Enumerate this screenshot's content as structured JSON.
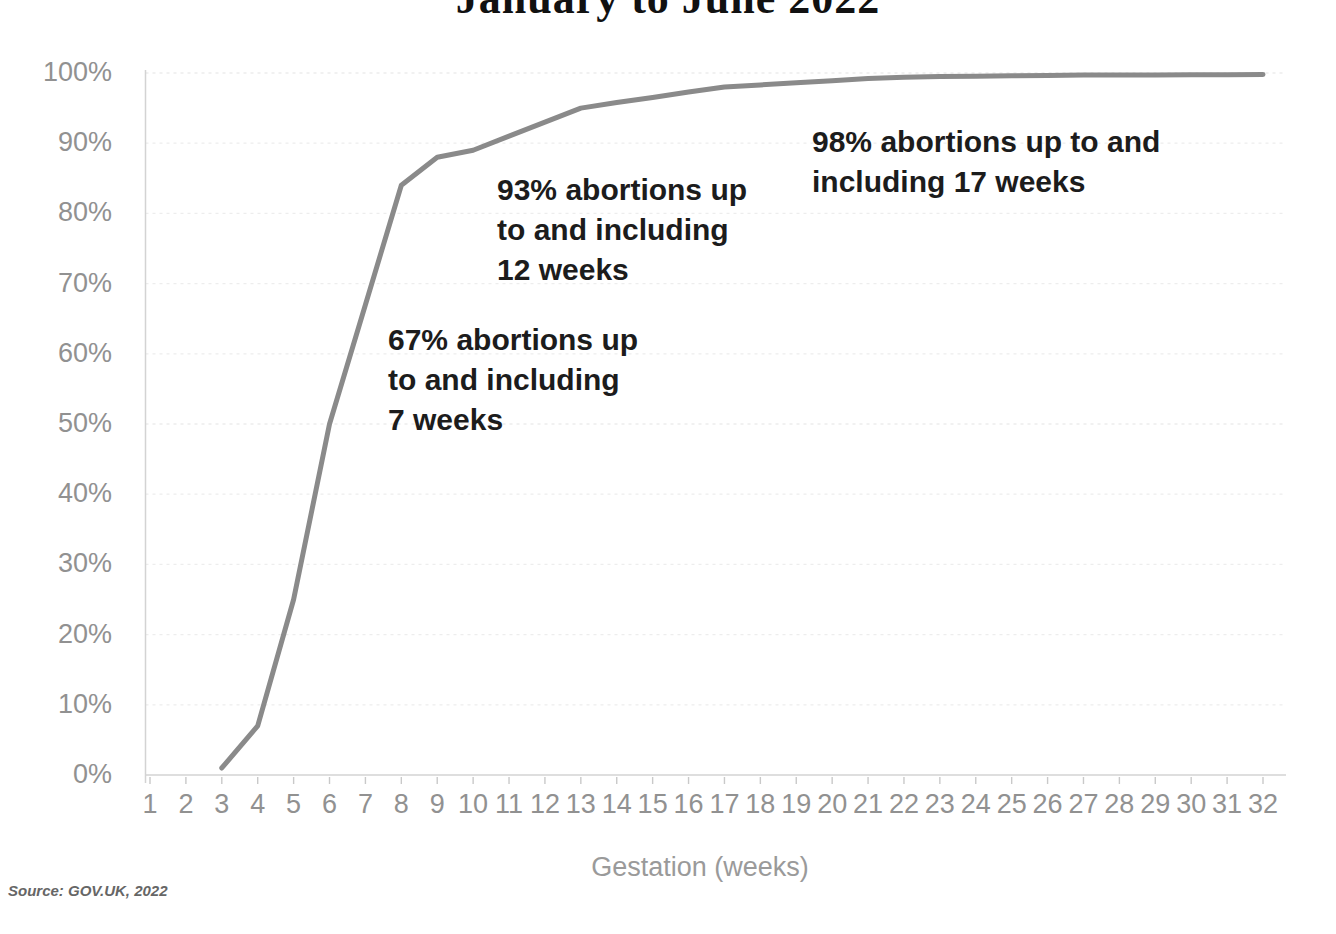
{
  "title": "January to June 2022",
  "source": "Source: GOV.UK, 2022",
  "annotations": [
    {
      "lines": [
        "67% abortions up",
        "to and including",
        "7 weeks"
      ]
    },
    {
      "lines": [
        "93% abortions up",
        "to and including",
        "12 weeks"
      ]
    },
    {
      "lines": [
        "98% abortions up to and",
        "including 17 weeks"
      ]
    }
  ],
  "colors": {
    "line": "#8a8a8a",
    "grid": "#ededed",
    "axis": "#d3d3d3",
    "tick": "#c9c9c9",
    "tick_label": "#919191",
    "annotation": "#1c1c1c",
    "title": "#111111",
    "source": "#666666"
  },
  "chart_data": {
    "type": "line",
    "title": "January to June 2022",
    "xlabel": "Gestation (weeks)",
    "ylabel": "",
    "xlim": [
      1,
      32
    ],
    "ylim": [
      0,
      100
    ],
    "grid": true,
    "legend": "none",
    "x_ticks": [
      1,
      2,
      3,
      4,
      5,
      6,
      7,
      8,
      9,
      10,
      11,
      12,
      13,
      14,
      15,
      16,
      17,
      18,
      19,
      20,
      21,
      22,
      23,
      24,
      25,
      26,
      27,
      28,
      29,
      30,
      31,
      32
    ],
    "y_tick_labels": [
      "0%",
      "10%",
      "20%",
      "30%",
      "40%",
      "50%",
      "60%",
      "70%",
      "80%",
      "90%",
      "100%"
    ],
    "y_tick_values": [
      0,
      10,
      20,
      30,
      40,
      50,
      60,
      70,
      80,
      90,
      100
    ],
    "series": [
      {
        "name": "Cumulative percentage of abortions",
        "x": [
          3,
          4,
          5,
          6,
          7,
          8,
          9,
          10,
          11,
          12,
          13,
          14,
          15,
          16,
          17,
          18,
          19,
          20,
          21,
          22,
          23,
          24,
          25,
          26,
          27,
          28,
          29,
          30,
          31,
          32
        ],
        "y": [
          1,
          7,
          25,
          50,
          67,
          84,
          88,
          89,
          91,
          93,
          95,
          95.8,
          96.5,
          97.3,
          98,
          98.3,
          98.6,
          98.9,
          99.2,
          99.4,
          99.5,
          99.55,
          99.6,
          99.65,
          99.7,
          99.7,
          99.72,
          99.74,
          99.76,
          99.78
        ]
      }
    ],
    "callouts": [
      {
        "text": "67% abortions up to and including 7 weeks",
        "week": 7,
        "value": 67
      },
      {
        "text": "93% abortions up to and including 12 weeks",
        "week": 12,
        "value": 93
      },
      {
        "text": "98% abortions up to and including 17 weeks",
        "week": 17,
        "value": 98
      }
    ]
  }
}
